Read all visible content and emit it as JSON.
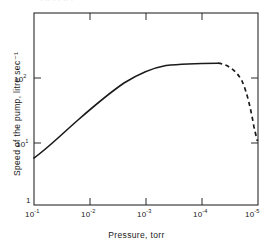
{
  "figure": {
    "top_fragment": "·  ··    ·    ·   ·· ·",
    "background_color": "#ffffff",
    "frame_color": "#2a2a2a",
    "curve_color": "#1a1a1a"
  },
  "chart_data": {
    "type": "line",
    "title": "",
    "xlabel": "Pressure, torr",
    "ylabel": "Speed of the pump, litre sec⁻¹",
    "xscale": "log",
    "yscale": "log",
    "x_axis_reversed": true,
    "xlim": [
      0.1,
      1e-05
    ],
    "ylim": [
      1,
      300
    ],
    "grid": false,
    "legend": null,
    "xticks": [
      {
        "value": 0.1,
        "label": "10",
        "exponent": "-1"
      },
      {
        "value": 0.01,
        "label": "10",
        "exponent": "-2"
      },
      {
        "value": 0.001,
        "label": "10",
        "exponent": "-3"
      },
      {
        "value": 0.0001,
        "label": "10",
        "exponent": "-4"
      },
      {
        "value": 1e-05,
        "label": "10",
        "exponent": "-5"
      }
    ],
    "yticks": [
      {
        "value": 1,
        "label": "1",
        "exponent": ""
      },
      {
        "value": 10,
        "label": "10",
        "exponent": "1"
      },
      {
        "value": 100,
        "label": "10",
        "exponent": "2"
      }
    ],
    "series": [
      {
        "name": "Pumping speed (measured)",
        "style": "solid",
        "x": [
          0.1,
          0.063,
          0.04,
          0.025,
          0.016,
          0.01,
          0.0063,
          0.004,
          0.0025,
          0.0016,
          0.001,
          0.00063,
          0.0004,
          0.00025,
          0.00016,
          0.0001,
          7e-05,
          5e-05
        ],
        "y": [
          6.0,
          9.0,
          13.5,
          20.0,
          28.0,
          38.0,
          52.0,
          70.0,
          92.0,
          112.0,
          130.0,
          142.0,
          149.0,
          151.0,
          152.0,
          152.0,
          152.0,
          152.0
        ]
      },
      {
        "name": "Pumping speed (extrapolated)",
        "style": "dashed",
        "x": [
          5e-05,
          4e-05,
          3.2e-05,
          2.5e-05,
          2e-05,
          1.6e-05,
          1.25e-05,
          1e-05
        ],
        "y": [
          152.0,
          146.0,
          136.0,
          120.0,
          98.0,
          70.0,
          38.0,
          14.0
        ]
      }
    ],
    "annotations": []
  }
}
